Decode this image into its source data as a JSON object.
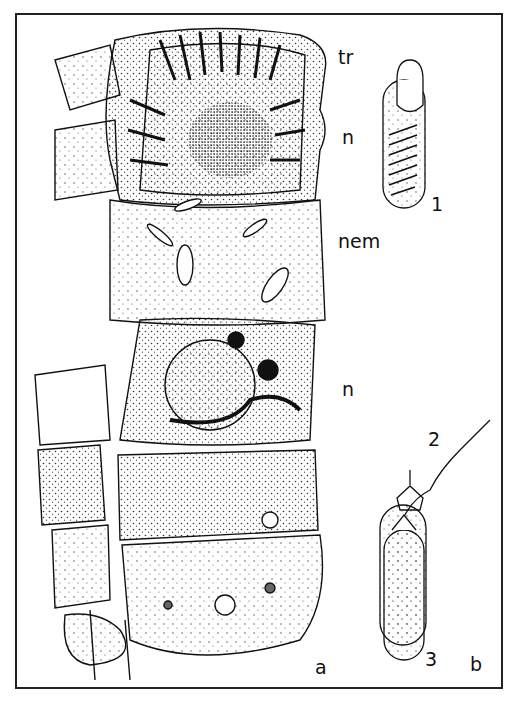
{
  "figure": {
    "panels": [
      {
        "id": "a",
        "label": "a",
        "description": "ciliate cell with trichocysts, nuclei and ingested nematocysts"
      },
      {
        "id": "b",
        "label": "b",
        "description": "nematocyst discharge stages"
      }
    ],
    "annotations": {
      "tr": "tr",
      "n_top": "n",
      "nem": "nem",
      "n_mid": "n"
    },
    "stages": [
      {
        "number": "1"
      },
      {
        "number": "2"
      },
      {
        "number": "3"
      }
    ]
  }
}
